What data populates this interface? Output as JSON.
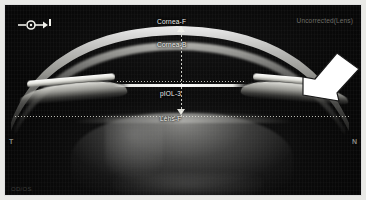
{
  "viewer": {
    "modality": "AS-OCT anterior segment scan",
    "status_label": "Uncorrected(Lens)",
    "corner_code": "OD/OS"
  },
  "icons": {
    "scan_orientation": "scan-direction-icon",
    "annotation_arrow": "annotation-arrow-icon"
  },
  "orientation": {
    "left_marker": "T",
    "right_marker": "N"
  },
  "annotations": {
    "cornea_front": "Cornea-F",
    "cornea_back": "Cornea-B",
    "piol": "pIOL-3",
    "lens_front": "Lens-F"
  },
  "colors": {
    "frame": "#e9e9e6",
    "canvas": "#070707",
    "label_text": "#f0f0ea",
    "status_text": "#6e6e68",
    "arrow_fill": "#ffffff",
    "tissue_bright": "#fdfdfb"
  }
}
